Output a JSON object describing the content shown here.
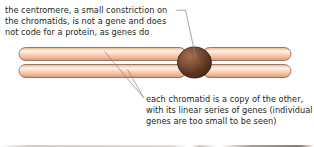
{
  "figure": {
    "background_color": "#ffffff",
    "width": 314,
    "height": 147
  },
  "annotations": {
    "centromere_caption": "the centromere, a small constriction on\nthe chromatids, is not a gene and does\nnot code for a protein, as genes do",
    "chromatid_caption": "each chromatid is a copy of the other,\nwith its linear series of genes (individual\ngenes are too small to be seen)"
  },
  "diagram": {
    "chromatid_color_light": "#fde3d0",
    "chromatid_color_mid": "#f6c3a4",
    "chromatid_color_dark": "#dfa383",
    "chromatid_outline": "#6b4a3a",
    "centromere_color_light": "#9a6a4e",
    "centromere_color_dark": "#4f2d1c",
    "centromere_outline": "#3a2113",
    "leader_line_color": "#8a8483",
    "text_color": "#231f1c",
    "labels": {
      "upper_chromatid": "chromatid",
      "lower_chromatid": "chromatid",
      "centromere": "centromere"
    }
  }
}
